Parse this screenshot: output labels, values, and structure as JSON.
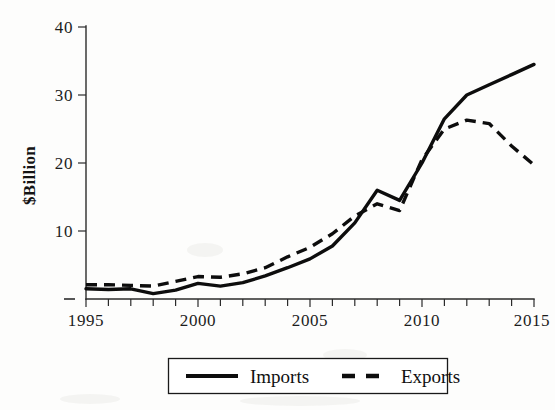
{
  "chart_data": {
    "type": "line",
    "title": "",
    "xlabel": "",
    "ylabel": "$Billion",
    "x": [
      1995,
      1996,
      1997,
      1998,
      1999,
      2000,
      2001,
      2002,
      2003,
      2004,
      2005,
      2006,
      2007,
      2008,
      2009,
      2010,
      2011,
      2012,
      2013,
      2014,
      2015
    ],
    "xlim": [
      1995,
      2015
    ],
    "ylim": [
      0,
      40
    ],
    "xticks": [
      1995,
      1996,
      1997,
      1998,
      1999,
      2000,
      2001,
      2002,
      2003,
      2004,
      2005,
      2006,
      2007,
      2008,
      2009,
      2010,
      2011,
      2012,
      2013,
      2014,
      2015
    ],
    "xticklabels": [
      "1995",
      "",
      "",
      "",
      "",
      "2000",
      "",
      "",
      "",
      "",
      "2005",
      "",
      "",
      "",
      "",
      "2010",
      "",
      "",
      "",
      "",
      "2015"
    ],
    "yticks": [
      0,
      10,
      20,
      30,
      40
    ],
    "yticklabels": [
      "–",
      "10",
      "20",
      "30",
      "40"
    ],
    "grid": false,
    "legend_position": "below-center",
    "series": [
      {
        "name": "Imports",
        "style": "solid",
        "color": "#0d0d0d",
        "values": [
          1.5,
          1.4,
          1.5,
          0.8,
          1.3,
          2.3,
          1.9,
          2.4,
          3.4,
          4.6,
          5.9,
          7.8,
          11.2,
          16.0,
          14.5,
          20.0,
          26.5,
          30.0,
          31.5,
          33.0,
          34.5
        ]
      },
      {
        "name": "Exports",
        "style": "dashed",
        "color": "#0d0d0d",
        "values": [
          2.1,
          2.1,
          2.0,
          1.9,
          2.6,
          3.3,
          3.2,
          3.7,
          4.6,
          6.2,
          7.6,
          9.6,
          12.2,
          14.0,
          13.0,
          20.5,
          25.0,
          26.3,
          25.8,
          22.5,
          19.7
        ]
      }
    ]
  },
  "axis": {
    "y_title": "$Billion",
    "y_tick_40": "40",
    "y_tick_30": "30",
    "y_tick_20": "20",
    "y_tick_10": "10",
    "y_tick_0": "–",
    "x_tick_1995": "1995",
    "x_tick_2000": "2000",
    "x_tick_2005": "2005",
    "x_tick_2010": "2010",
    "x_tick_2015": "2015"
  },
  "legend": {
    "imports_label": "Imports",
    "exports_label": "Exports"
  }
}
